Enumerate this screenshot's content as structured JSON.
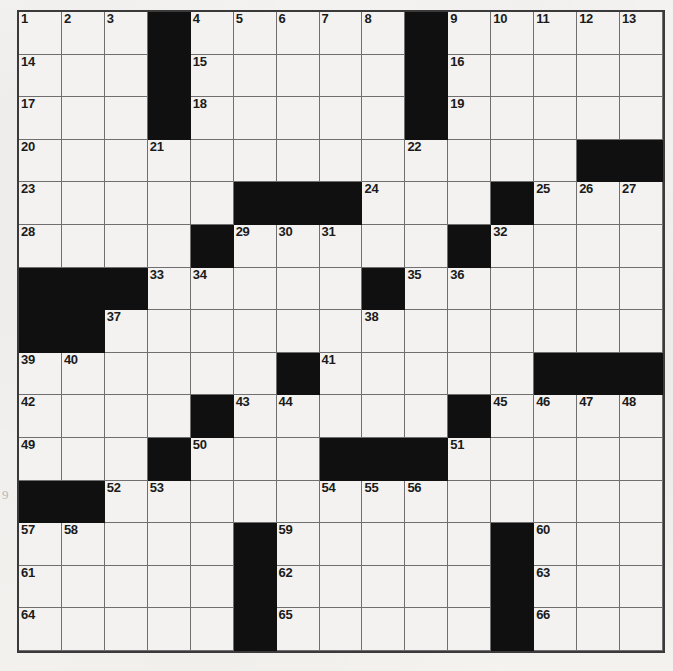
{
  "document": {
    "type": "crossword-puzzle-grid",
    "title": "Crossword Puzzle",
    "grid_size": {
      "rows": 15,
      "cols": 15
    },
    "colors": {
      "paper": "#f3f2f0",
      "block": "#101010",
      "rule": "#6f6f6f",
      "number": "#1b1b1b",
      "margin_mark": "#b9b7b4"
    },
    "margin_mark": "9",
    "max_clue_number": 66
  },
  "grid": {
    "legend": {
      "white": ".",
      "black": "#"
    },
    "rows": [
      "...#.....#.....",
      "...#.....#.....",
      "...#.....#.....",
      ".............##",
      ".....###...#...",
      "....#.....#....",
      "###.....#......",
      "##.............",
      "......#.....###",
      "....#.....#....",
      "...#...###.....",
      "##.............",
      ".....#.....#...",
      ".....#.....#...",
      ".....#.....#..."
    ],
    "numbers": [
      {
        "row": 1,
        "col": 1,
        "n": 1
      },
      {
        "row": 1,
        "col": 2,
        "n": 2
      },
      {
        "row": 1,
        "col": 3,
        "n": 3
      },
      {
        "row": 1,
        "col": 5,
        "n": 4
      },
      {
        "row": 1,
        "col": 6,
        "n": 5
      },
      {
        "row": 1,
        "col": 7,
        "n": 6
      },
      {
        "row": 1,
        "col": 8,
        "n": 7
      },
      {
        "row": 1,
        "col": 9,
        "n": 8
      },
      {
        "row": 1,
        "col": 11,
        "n": 9
      },
      {
        "row": 1,
        "col": 12,
        "n": 10
      },
      {
        "row": 1,
        "col": 13,
        "n": 11
      },
      {
        "row": 1,
        "col": 14,
        "n": 12
      },
      {
        "row": 1,
        "col": 15,
        "n": 13
      },
      {
        "row": 2,
        "col": 1,
        "n": 14
      },
      {
        "row": 2,
        "col": 5,
        "n": 15
      },
      {
        "row": 2,
        "col": 11,
        "n": 16
      },
      {
        "row": 3,
        "col": 1,
        "n": 17
      },
      {
        "row": 3,
        "col": 5,
        "n": 18
      },
      {
        "row": 3,
        "col": 11,
        "n": 19
      },
      {
        "row": 4,
        "col": 1,
        "n": 20
      },
      {
        "row": 4,
        "col": 4,
        "n": 21
      },
      {
        "row": 4,
        "col": 10,
        "n": 22
      },
      {
        "row": 5,
        "col": 1,
        "n": 23
      },
      {
        "row": 5,
        "col": 9,
        "n": 24
      },
      {
        "row": 5,
        "col": 13,
        "n": 25
      },
      {
        "row": 5,
        "col": 14,
        "n": 26
      },
      {
        "row": 5,
        "col": 15,
        "n": 27
      },
      {
        "row": 6,
        "col": 1,
        "n": 28
      },
      {
        "row": 6,
        "col": 6,
        "n": 29
      },
      {
        "row": 6,
        "col": 7,
        "n": 30
      },
      {
        "row": 6,
        "col": 8,
        "n": 31
      },
      {
        "row": 6,
        "col": 12,
        "n": 32
      },
      {
        "row": 7,
        "col": 4,
        "n": 33
      },
      {
        "row": 7,
        "col": 5,
        "n": 34
      },
      {
        "row": 7,
        "col": 10,
        "n": 35
      },
      {
        "row": 7,
        "col": 11,
        "n": 36
      },
      {
        "row": 8,
        "col": 3,
        "n": 37
      },
      {
        "row": 8,
        "col": 9,
        "n": 38
      },
      {
        "row": 9,
        "col": 1,
        "n": 39
      },
      {
        "row": 9,
        "col": 2,
        "n": 40
      },
      {
        "row": 9,
        "col": 8,
        "n": 41
      },
      {
        "row": 10,
        "col": 1,
        "n": 42
      },
      {
        "row": 10,
        "col": 6,
        "n": 43
      },
      {
        "row": 10,
        "col": 7,
        "n": 44
      },
      {
        "row": 10,
        "col": 12,
        "n": 45
      },
      {
        "row": 10,
        "col": 13,
        "n": 46
      },
      {
        "row": 10,
        "col": 14,
        "n": 47
      },
      {
        "row": 10,
        "col": 15,
        "n": 48
      },
      {
        "row": 11,
        "col": 1,
        "n": 49
      },
      {
        "row": 11,
        "col": 5,
        "n": 50
      },
      {
        "row": 11,
        "col": 11,
        "n": 51
      },
      {
        "row": 12,
        "col": 3,
        "n": 52
      },
      {
        "row": 12,
        "col": 4,
        "n": 53
      },
      {
        "row": 12,
        "col": 8,
        "n": 54
      },
      {
        "row": 12,
        "col": 9,
        "n": 55
      },
      {
        "row": 12,
        "col": 10,
        "n": 56
      },
      {
        "row": 13,
        "col": 1,
        "n": 57
      },
      {
        "row": 13,
        "col": 2,
        "n": 58
      },
      {
        "row": 13,
        "col": 7,
        "n": 59
      },
      {
        "row": 13,
        "col": 13,
        "n": 60
      },
      {
        "row": 14,
        "col": 1,
        "n": 61
      },
      {
        "row": 14,
        "col": 7,
        "n": 62
      },
      {
        "row": 14,
        "col": 13,
        "n": 63
      },
      {
        "row": 15,
        "col": 1,
        "n": 64
      },
      {
        "row": 15,
        "col": 7,
        "n": 65
      },
      {
        "row": 15,
        "col": 13,
        "n": 66
      }
    ],
    "entries": []
  }
}
